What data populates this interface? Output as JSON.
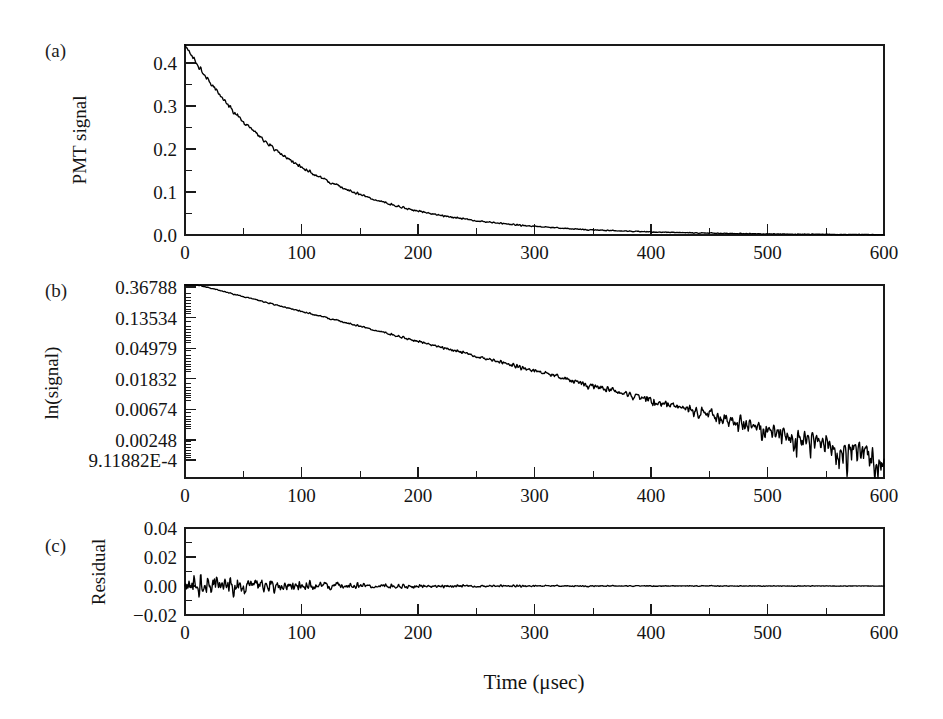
{
  "figure": {
    "caption_letters": [
      "(a)",
      "(b)",
      "(c)"
    ],
    "xlabel": "Time (μsec)",
    "background": "#ffffff",
    "trace_color": "#000000"
  },
  "chart_data": [
    {
      "type": "line",
      "panel": "(a)",
      "title": "",
      "xlabel": "Time (μsec)",
      "ylabel": "PMT signal",
      "xlim": [
        0,
        600
      ],
      "ylim": [
        0.0,
        0.442
      ],
      "xticks": [
        0,
        100,
        200,
        300,
        400,
        500,
        600
      ],
      "xtick_labels": [
        "0",
        "100",
        "200",
        "300",
        "400",
        "500",
        "600"
      ],
      "xminor_step": 50,
      "yticks": [
        0.0,
        0.1,
        0.2,
        0.3,
        0.4
      ],
      "ytick_labels": [
        "0.0",
        "0.1",
        "0.2",
        "0.3",
        "0.4"
      ],
      "yminor_step": 0.05,
      "yscale": "linear",
      "grid": false,
      "legend": "none",
      "model": "exponential decay",
      "amplitude": 0.4425,
      "tau_usec": 97.0,
      "offset": 0.0,
      "noise_sigma": 0.0035,
      "x": [
        0,
        25,
        50,
        75,
        100,
        125,
        150,
        175,
        200,
        250,
        300,
        350,
        400,
        450,
        500,
        550,
        600
      ],
      "y": [
        0.4425,
        0.342,
        0.265,
        0.205,
        0.1585,
        0.1228,
        0.095,
        0.0735,
        0.0568,
        0.034,
        0.0204,
        0.0122,
        0.0073,
        0.0044,
        0.0026,
        0.0016,
        0.0009
      ]
    },
    {
      "type": "line",
      "panel": "(b)",
      "title": "",
      "xlabel": "Time (μsec)",
      "ylabel": "ln(signal)",
      "xlim": [
        0,
        600
      ],
      "xticks": [
        0,
        100,
        200,
        300,
        400,
        500,
        600
      ],
      "xtick_labels": [
        "0",
        "100",
        "200",
        "300",
        "400",
        "500",
        "600"
      ],
      "xminor_step": 50,
      "yscale": "log",
      "ytick_values": [
        0.36788,
        0.13534,
        0.04979,
        0.01832,
        0.00674,
        0.00248,
        0.000911882
      ],
      "ytick_labels": [
        "0.36788",
        "0.13534",
        "0.04979",
        "0.01832",
        "0.00674",
        "0.00248",
        "9.11882E-4"
      ],
      "ylim": [
        0.000911882,
        0.45
      ],
      "grid": false,
      "legend": "none",
      "note": "linear on log axis; slope = -1/tau, noise grows at long times",
      "x": [
        0,
        50,
        100,
        150,
        200,
        250,
        300,
        350,
        400,
        450,
        500,
        550,
        600
      ],
      "y": [
        0.4425,
        0.265,
        0.1585,
        0.095,
        0.0568,
        0.034,
        0.0204,
        0.0122,
        0.0073,
        0.0044,
        0.0026,
        0.0016,
        0.0009
      ]
    },
    {
      "type": "line",
      "panel": "(c)",
      "title": "",
      "xlabel": "Time (μsec)",
      "ylabel": "Residual",
      "xlim": [
        0,
        600
      ],
      "ylim": [
        -0.02,
        0.04
      ],
      "xticks": [
        0,
        100,
        200,
        300,
        400,
        500,
        600
      ],
      "xtick_labels": [
        "0",
        "100",
        "200",
        "300",
        "400",
        "500",
        "600"
      ],
      "xminor_step": 50,
      "yticks": [
        -0.02,
        0.0,
        0.02,
        0.04
      ],
      "ytick_labels": [
        "−0.02",
        "0.00",
        "0.02",
        "0.04"
      ],
      "yscale": "linear",
      "grid": false,
      "legend": "none",
      "note": "residual scatter about zero, amplitude decays with time",
      "x": [
        0,
        50,
        100,
        150,
        200,
        300,
        400,
        500,
        600
      ],
      "residual_envelope": [
        0.006,
        0.0045,
        0.0032,
        0.0022,
        0.0016,
        0.0011,
        0.0008,
        0.0007,
        0.0006
      ]
    }
  ],
  "panels": {
    "a": {
      "letter": "(a)",
      "ylabel": "PMT signal",
      "ytick_labels": [
        "0.4",
        "0.3",
        "0.2",
        "0.1",
        "0.0"
      ],
      "xtick_labels": [
        "0",
        "100",
        "200",
        "300",
        "400",
        "500",
        "600"
      ]
    },
    "b": {
      "letter": "(b)",
      "ylabel": "ln(signal)",
      "ytick_labels": [
        "0.36788",
        "0.13534",
        "0.04979",
        "0.01832",
        "0.00674",
        "0.00248",
        "9.11882E-4"
      ],
      "xtick_labels": [
        "0",
        "100",
        "200",
        "300",
        "400",
        "500",
        "600"
      ]
    },
    "c": {
      "letter": "(c)",
      "ylabel": "Residual",
      "ytick_labels": [
        "0.04",
        "0.02",
        "0.00",
        "−0.02"
      ],
      "xtick_labels": [
        "0",
        "100",
        "200",
        "300",
        "400",
        "500",
        "600"
      ]
    }
  }
}
